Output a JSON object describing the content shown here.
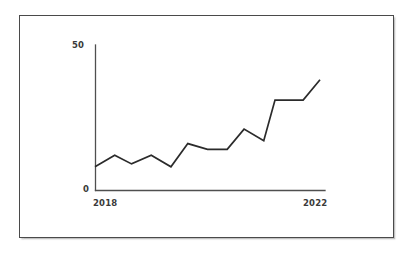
{
  "figure": {
    "background_color": "#ffffff",
    "frame_color": "#4a4a4a",
    "line_color": "#2b2b2b"
  },
  "axes": {
    "y_top_label": "50",
    "y_bottom_label": "0",
    "x_left_label": "2018",
    "x_right_label": "2022"
  },
  "chart_data": {
    "type": "line",
    "title": "",
    "subtitle": "",
    "xlabel": "",
    "ylabel": "",
    "xlim": [
      2018,
      2022
    ],
    "ylim": [
      0,
      50
    ],
    "yticks": [
      0,
      50
    ],
    "ytick_labels": [
      "0",
      "50"
    ],
    "xticks": [
      2018,
      2022
    ],
    "xtick_labels": [
      "2018",
      "2022"
    ],
    "grid": false,
    "legend": false,
    "legend_position": "none",
    "series": [
      {
        "name": "series-1",
        "color": "#2b2b2b",
        "x": [
          2018.0,
          2018.35,
          2018.65,
          2019.0,
          2019.35,
          2019.65,
          2020.0,
          2020.35,
          2020.65,
          2021.0,
          2021.2,
          2021.45,
          2021.7,
          2022.0
        ],
        "values": [
          8,
          12,
          9,
          12,
          8,
          16,
          14,
          14,
          21,
          17,
          31,
          31,
          31,
          38
        ]
      }
    ],
    "annotations": []
  }
}
